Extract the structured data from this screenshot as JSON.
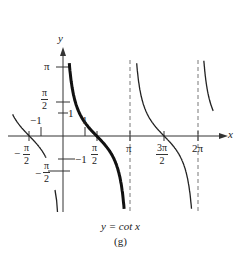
{
  "figure": {
    "caption": "y = cot x",
    "sublabel": "(g)"
  },
  "axes": {
    "x_label": "x",
    "y_label": "y",
    "x_ticks": [
      "-π/2",
      "-1",
      "1",
      "π/2",
      "π",
      "3π/2",
      "2π"
    ],
    "y_ticks": [
      "π",
      "π/2",
      "1",
      "-1",
      "-π/2"
    ]
  },
  "labels": {
    "pi": "π",
    "two": "2",
    "three_pi": "3π",
    "two_pi": "2π",
    "minus": "−",
    "one": "1",
    "neg_one": "−1"
  },
  "chart_data": {
    "type": "line",
    "title": "y = cot x",
    "subtitle": "(g)",
    "xlabel": "x",
    "ylabel": "y",
    "series": [
      {
        "name": "cot x (primary branch, bold)",
        "domain": [
          0,
          3.14159
        ],
        "function": "cot(x)"
      },
      {
        "name": "cot x (branch)",
        "domain": [
          -3.14159,
          0
        ],
        "function": "cot(x)"
      },
      {
        "name": "cot x (branch)",
        "domain": [
          3.14159,
          6.28318
        ],
        "function": "cot(x)"
      },
      {
        "name": "cot x (branch)",
        "domain": [
          6.28318,
          6.8
        ],
        "function": "cot(x)"
      },
      {
        "name": "y = x (reflection reference, partial)",
        "function": "x"
      }
    ],
    "asymptotes_x": [
      "π",
      "2π"
    ],
    "x_ticks": [
      "-π/2",
      "-1",
      "1",
      "π/2",
      "π",
      "3π/2",
      "2π"
    ],
    "y_ticks": [
      "π",
      "π/2",
      "1",
      "-1",
      "-π/2"
    ],
    "grid": false
  }
}
